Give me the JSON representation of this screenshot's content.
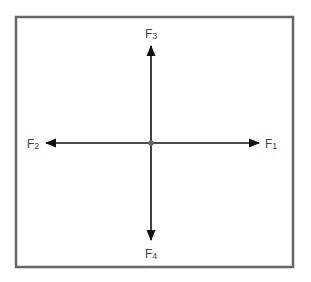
{
  "diagram": {
    "type": "force-diagram",
    "frame": {
      "x": 15,
      "y": 16,
      "width": 278,
      "height": 251,
      "color": "#666666"
    },
    "origin": {
      "x": 151,
      "y": 143,
      "color": "#666666"
    },
    "arrow_color": "#111111",
    "forces": [
      {
        "id": "F1",
        "base": "F",
        "sub": "1",
        "direction": "right",
        "end": {
          "x": 259,
          "y": 143
        },
        "label_pos": {
          "x": 265,
          "y": 147
        }
      },
      {
        "id": "F2",
        "base": "F",
        "sub": "2",
        "direction": "left",
        "end": {
          "x": 46,
          "y": 143
        },
        "label_pos": {
          "x": 27,
          "y": 147
        }
      },
      {
        "id": "F3",
        "base": "F",
        "sub": "3",
        "direction": "up",
        "end": {
          "x": 151,
          "y": 46
        },
        "label_pos": {
          "x": 145,
          "y": 37
        }
      },
      {
        "id": "F4",
        "base": "F",
        "sub": "4",
        "direction": "down",
        "end": {
          "x": 151,
          "y": 240
        },
        "label_pos": {
          "x": 145,
          "y": 257
        }
      }
    ]
  }
}
